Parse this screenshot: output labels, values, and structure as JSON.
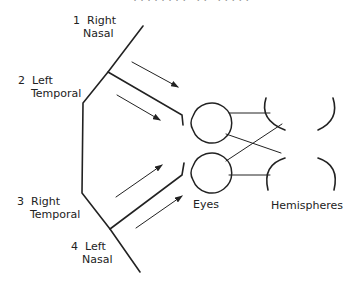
{
  "header": {
    "partial_text": "........ .. ....."
  },
  "labels": {
    "region1": {
      "num": "1",
      "line1": "Right",
      "line2": "Nasal"
    },
    "region2": {
      "num": "2",
      "line1": "Left",
      "line2": "Temporal"
    },
    "region3": {
      "num": "3",
      "line1": "Right",
      "line2": "Temporal"
    },
    "region4": {
      "num": "4",
      "line1": "Left",
      "line2": "Nasal"
    },
    "eyes": "Eyes",
    "hemispheres": "Hemispheres"
  },
  "colors": {
    "stroke": "#222222",
    "background": "#ffffff"
  }
}
